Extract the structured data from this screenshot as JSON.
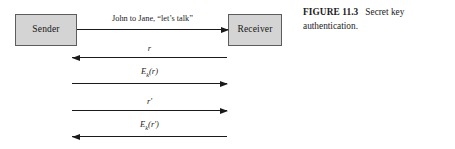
{
  "figure": {
    "caption_number": "FIGURE 11.3",
    "caption_text": "Secret key authentication."
  },
  "actors": {
    "sender": "Sender",
    "receiver": "Receiver"
  },
  "messages": [
    {
      "id": "msg-initiate",
      "label": "John to Jane, “let’s talk”",
      "direction": "right",
      "from": "Sender",
      "to": "Receiver"
    },
    {
      "id": "msg-challenge-r",
      "label": "r",
      "direction": "left",
      "from": "Receiver",
      "to": "Sender"
    },
    {
      "id": "msg-response-ekr",
      "label_base": "E",
      "label_sub": "k",
      "label_arg": "(r)",
      "label": "Eₖ(r)",
      "direction": "right",
      "from": "Sender",
      "to": "Receiver"
    },
    {
      "id": "msg-challenge-rprime",
      "label": "r′",
      "direction": "right",
      "from": "Sender",
      "to": "Receiver"
    },
    {
      "id": "msg-response-ekrprime",
      "label_base": "E",
      "label_sub": "k",
      "label_arg": "(r′)",
      "label": "Eₖ(r′)",
      "direction": "left",
      "from": "Receiver",
      "to": "Sender"
    }
  ],
  "colors": {
    "box_fill": "#d4d4d4",
    "box_border": "#5d5d5d",
    "line": "#1a1a1a",
    "text": "#1a1a1a",
    "background": "#ffffff"
  }
}
